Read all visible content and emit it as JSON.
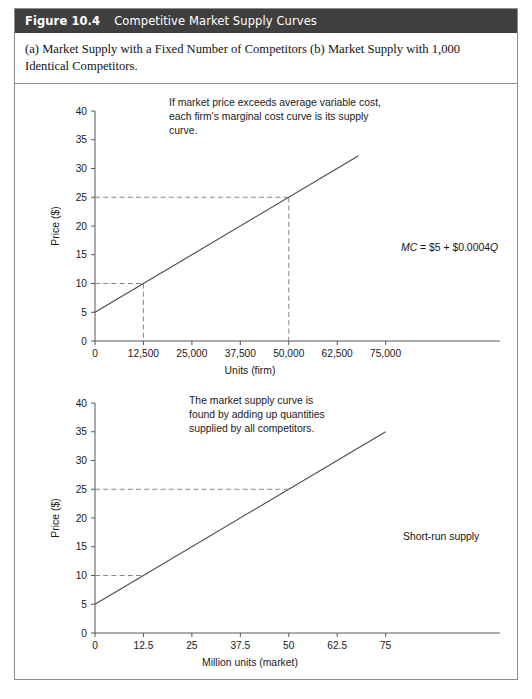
{
  "figure": {
    "number": "Figure 10.4",
    "title": "Competitive Market Supply Curves",
    "caption": "(a) Market Supply with a Fixed Number of Competitors (b) Market Supply with 1,000 Identical Competitors.",
    "header_bg": "#3f3f3f",
    "header_fg": "#ffffff",
    "border_color": "#8d8d8d"
  },
  "chart_data": [
    {
      "id": "panel-a",
      "type": "line",
      "title": "",
      "xlabel": "Units (firm)",
      "ylabel": "Price ($)",
      "xlim": [
        0,
        80000
      ],
      "ylim": [
        0,
        40
      ],
      "xticks": [
        0,
        12500,
        25000,
        37500,
        50000,
        62500,
        75000
      ],
      "xticklabels": [
        "0",
        "12,500",
        "25,000",
        "37,500",
        "50,000",
        "62,500",
        "75,000"
      ],
      "yticks": [
        0,
        5,
        10,
        15,
        20,
        25,
        30,
        35,
        40
      ],
      "yticklabels": [
        "0",
        "5",
        "10",
        "15",
        "20",
        "25",
        "30",
        "35",
        "40"
      ],
      "grid": false,
      "series": [
        {
          "name": "MC = $5 + $0.0004Q",
          "x": [
            0,
            68000
          ],
          "values": [
            5,
            32.2
          ],
          "intercept": 5,
          "slope": 0.0004,
          "color": "#4d4d4d"
        }
      ],
      "annotations": [
        {
          "name": "note",
          "text": "If market price exceeds average variable cost,\neach firm's marginal cost curve is its supply\ncurve."
        },
        {
          "name": "curve-equation",
          "text_plain": "MC = $5 + $0.0004Q",
          "italic_prefix": "MC",
          "text_rest": " = $5 + $0.0004",
          "italic_suffix": "Q"
        }
      ],
      "guides": [
        {
          "name": "guide-12500",
          "x": 12500,
          "y": 10,
          "horizontal": true,
          "vertical": true
        },
        {
          "name": "guide-50000",
          "x": 50000,
          "y": 25,
          "horizontal": true,
          "vertical": true
        }
      ]
    },
    {
      "id": "panel-b",
      "type": "line",
      "title": "",
      "xlabel": "Million units (market)",
      "ylabel": "Price ($)",
      "xlim": [
        0,
        80
      ],
      "ylim": [
        0,
        40
      ],
      "xticks": [
        0,
        12.5,
        25,
        37.5,
        50,
        62.5,
        75
      ],
      "xticklabels": [
        "0",
        "12.5",
        "25",
        "37.5",
        "50",
        "62.5",
        "75"
      ],
      "yticks": [
        0,
        5,
        10,
        15,
        20,
        25,
        30,
        35,
        40
      ],
      "yticklabels": [
        "0",
        "5",
        "10",
        "15",
        "20",
        "25",
        "30",
        "35",
        "40"
      ],
      "grid": false,
      "series": [
        {
          "name": "Short-run supply",
          "x": [
            0,
            75
          ],
          "values": [
            5,
            35
          ],
          "intercept": 5,
          "slope": 0.4,
          "color": "#4d4d4d"
        }
      ],
      "annotations": [
        {
          "name": "note",
          "text": "The market supply curve is\nfound by adding up quantities\nsupplied by all competitors."
        },
        {
          "name": "curve-label",
          "text_plain": "Short-run supply"
        }
      ],
      "guides": [
        {
          "name": "guide-12-5",
          "x": 12.5,
          "y": 10,
          "horizontal": true,
          "vertical": false
        },
        {
          "name": "guide-50",
          "x": 50,
          "y": 25,
          "horizontal": true,
          "vertical": false
        }
      ]
    }
  ]
}
